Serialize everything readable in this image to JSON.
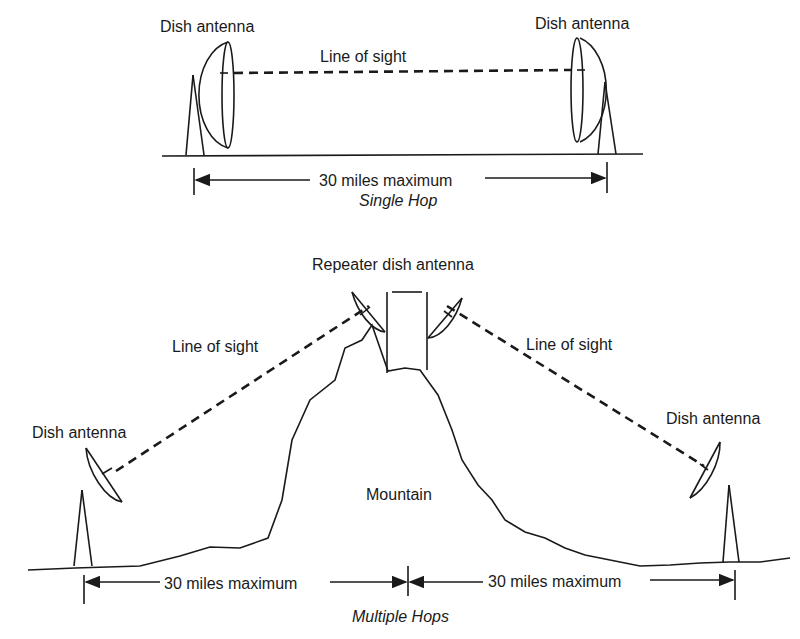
{
  "single_hop": {
    "left_antenna_label": "Dish antenna",
    "right_antenna_label": "Dish antenna",
    "link_label": "Line of sight",
    "distance_label": "30 miles maximum",
    "caption": "Single Hop"
  },
  "multiple_hops": {
    "repeater_label": "Repeater dish antenna",
    "left_link_label": "Line of sight",
    "right_link_label": "Line of sight",
    "left_antenna_label": "Dish antenna",
    "right_antenna_label": "Dish antenna",
    "terrain_label": "Mountain",
    "left_distance_label": "30 miles maximum",
    "right_distance_label": "30 miles maximum",
    "caption": "Multiple Hops"
  }
}
